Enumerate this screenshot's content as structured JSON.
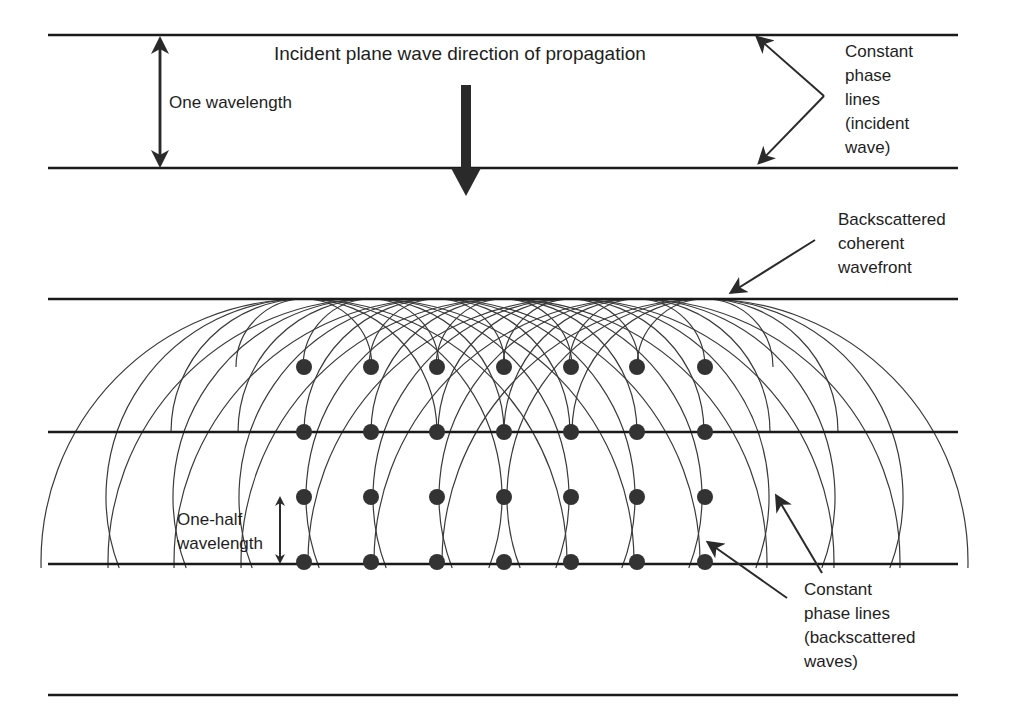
{
  "labels": {
    "title": "Incident plane wave direction of propagation",
    "one_wavelength": "One wavelength",
    "incident_phase_lines": "Constant\nphase\nlines\n(incident\nwave)",
    "backscattered_wavefront": "Backscattered\ncoherent\nwavefront",
    "one_half_wavelength": "One-half\nwavelength",
    "backscattered_phase_lines": "Constant\nphase lines\n(backscattered\nwaves)"
  },
  "geometry": {
    "line_x1": 48,
    "line_x2": 958,
    "horizontal_lines_y": [
      35,
      168,
      299,
      432,
      564,
      695
    ],
    "wavefront_y": 299,
    "arc_bottom_y": 568,
    "scatterer_x": [
      304,
      371,
      437,
      504,
      571,
      637,
      705
    ],
    "scatterer_y": [
      367,
      432,
      497,
      562
    ],
    "scatterer_radius": 8,
    "colors": {
      "line": "#1a1a1a",
      "arc": "#3a3a3a",
      "dot": "#333333"
    }
  }
}
